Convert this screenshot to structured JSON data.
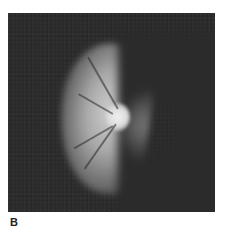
{
  "figure": {
    "panel_label": "B",
    "image_description": "Fundus photograph showing optic disc with bright crescent-shaped illuminated retinal area on dark background",
    "colors": {
      "background": "#2b2b2b",
      "highlight": "#d8d8d8",
      "page": "#ffffff"
    }
  }
}
